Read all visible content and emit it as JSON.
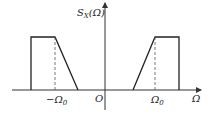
{
  "diagram": {
    "y_label": "S",
    "y_label_sub": "X",
    "y_label_arg": "(Ω)",
    "x_label": "Ω",
    "origin_label": "O",
    "neg_tick_label": "−Ω",
    "neg_tick_sub": "0",
    "pos_tick_label": "Ω",
    "pos_tick_sub": "0"
  }
}
